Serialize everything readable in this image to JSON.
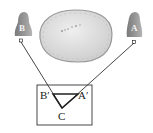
{
  "diagram": {
    "objects": [
      {
        "id": "B",
        "label": "B",
        "kind": "bell-shaped-object"
      },
      {
        "id": "A",
        "label": "A",
        "kind": "bell-shaped-object"
      }
    ],
    "obstacle": {
      "kind": "lake"
    },
    "box": {
      "points": {
        "b_prime": "B′",
        "a_prime": "A′",
        "c": "C"
      }
    },
    "colors": {
      "mountain": "#8c8c8c",
      "lake_fill": "#d9d9d9",
      "lake_rim": "#9a9a9a",
      "lines": "#333333"
    }
  }
}
